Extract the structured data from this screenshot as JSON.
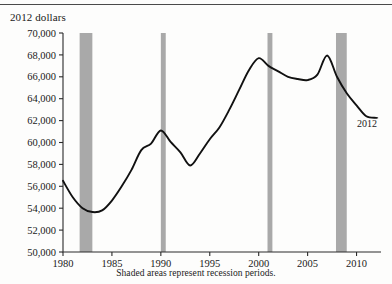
{
  "figure": {
    "y_axis_title": "2012 dollars",
    "caption": "Shaded areas represent recession periods.",
    "end_annotation": "2012"
  },
  "chart_data": {
    "type": "line",
    "title": "",
    "xlabel": "",
    "ylabel": "2012 dollars",
    "xlim": [
      1980,
      2012.5
    ],
    "ylim": [
      50000,
      70000
    ],
    "ytick_values": [
      50000,
      52000,
      54000,
      56000,
      58000,
      60000,
      62000,
      64000,
      66000,
      68000,
      70000
    ],
    "ytick_labels": [
      "50,000",
      "52,000",
      "54,000",
      "56,000",
      "58,000",
      "60,000",
      "62,000",
      "64,000",
      "66,000",
      "68,000",
      "70,000"
    ],
    "xtick_values": [
      1980,
      1985,
      1990,
      1995,
      2000,
      2005,
      2010
    ],
    "xtick_labels": [
      "1980",
      "1985",
      "1990",
      "1995",
      "2000",
      "2005",
      "2010"
    ],
    "grid": false,
    "legend": "none",
    "series": [
      {
        "name": "Real median household income (2012 dollars)",
        "x": [
          1980,
          1981,
          1982,
          1983,
          1984,
          1985,
          1986,
          1987,
          1988,
          1989,
          1990,
          1991,
          1992,
          1993,
          1994,
          1995,
          1996,
          1997,
          1998,
          1999,
          2000,
          2001,
          2002,
          2003,
          2004,
          2005,
          2006,
          2007,
          2008,
          2009,
          2010,
          2011,
          2012
        ],
        "values": [
          56500,
          55000,
          54000,
          53650,
          53800,
          54700,
          56000,
          57500,
          59300,
          59900,
          61100,
          60050,
          59100,
          57900,
          59000,
          60300,
          61400,
          63000,
          64800,
          66600,
          67700,
          67000,
          66500,
          66000,
          65800,
          65700,
          66200,
          67950,
          66000,
          64500,
          63400,
          62400,
          62250
        ]
      }
    ],
    "recession_bands": [
      {
        "start": 1981.7,
        "end": 1983.0,
        "label": "1981-82 recession"
      },
      {
        "start": 1990.0,
        "end": 1990.5,
        "label": "1990-91 recession"
      },
      {
        "start": 2000.9,
        "end": 2001.4,
        "label": "2001 recession"
      },
      {
        "start": 2007.9,
        "end": 2009.0,
        "label": "2007-09 recession"
      }
    ],
    "annotations": [
      {
        "text": "2012",
        "x": 2012,
        "y": 62250
      }
    ]
  }
}
